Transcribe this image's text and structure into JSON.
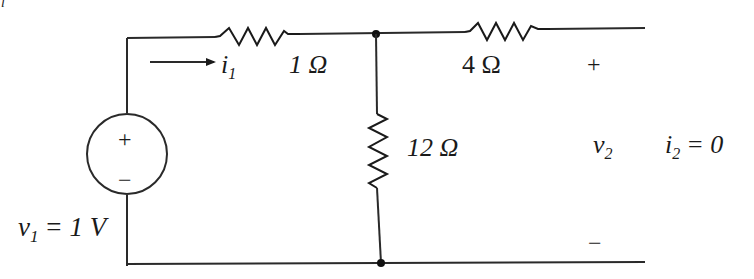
{
  "diagram": {
    "type": "circuit",
    "source": {
      "name": "v1",
      "label": "v",
      "subscript": "1",
      "value_text": "= 1 V",
      "plus": "+",
      "minus": "−"
    },
    "current_in": {
      "label": "i",
      "subscript": "1"
    },
    "resistors": [
      {
        "id": "r1",
        "value": "1 Ω",
        "orientation": "horizontal"
      },
      {
        "id": "r2",
        "value": "4 Ω",
        "orientation": "horizontal"
      },
      {
        "id": "r3",
        "value": "12 Ω",
        "orientation": "vertical"
      }
    ],
    "output": {
      "label": "v",
      "subscript": "2",
      "plus": "+",
      "minus": "−",
      "current_label": "i",
      "current_subscript": "2",
      "current_value": "= 0"
    },
    "corner_mark": "l"
  }
}
